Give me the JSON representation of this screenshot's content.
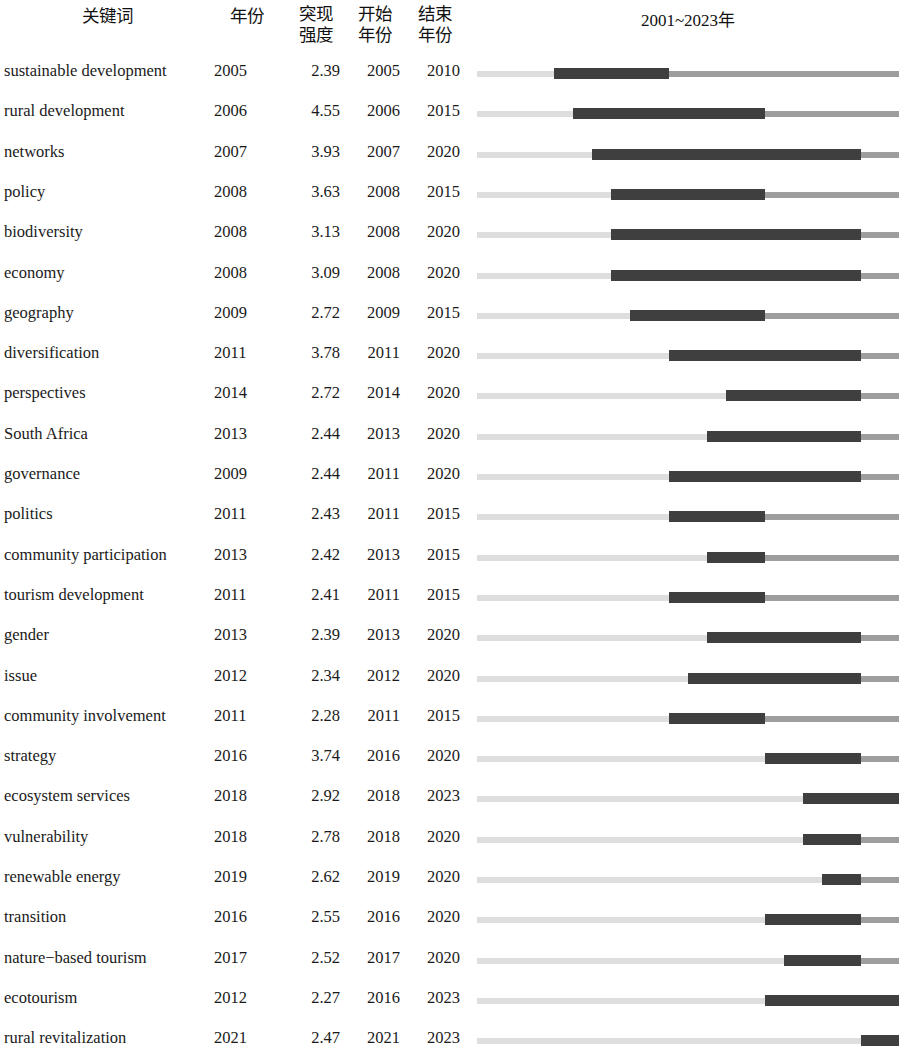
{
  "header": {
    "keyword": "关键词",
    "year": "年份",
    "strength": "突现\n强度",
    "begin": "开始\n年份",
    "end": "结束\n年份",
    "span": "2001~2023年"
  },
  "timeline": {
    "start_year": 2001,
    "end_year": 2023,
    "colors": {
      "pre_burst": "#dedede",
      "post_burst": "#9e9e9e",
      "burst": "#3f3f3f"
    }
  },
  "chart_data": {
    "type": "table",
    "xlabel": "2001~2023年",
    "ylabel": "关键词",
    "columns": [
      "关键词",
      "年份",
      "突现强度",
      "开始年份",
      "结束年份",
      "2001~2023年"
    ],
    "axis_range": [
      2001,
      2023
    ],
    "rows": [
      {
        "keyword": "sustainable development",
        "year": "2005",
        "strength": "2.39",
        "begin": "2005",
        "end": "2010",
        "begin_year": 2005,
        "end_year": 2010,
        "strength_value": 2.39
      },
      {
        "keyword": "rural development",
        "year": "2006",
        "strength": "4.55",
        "begin": "2006",
        "end": "2015",
        "begin_year": 2006,
        "end_year": 2015,
        "strength_value": 4.55
      },
      {
        "keyword": "networks",
        "year": "2007",
        "strength": "3.93",
        "begin": "2007",
        "end": "2020",
        "begin_year": 2007,
        "end_year": 2020,
        "strength_value": 3.93
      },
      {
        "keyword": "policy",
        "year": "2008",
        "strength": "3.63",
        "begin": "2008",
        "end": "2015",
        "begin_year": 2008,
        "end_year": 2015,
        "strength_value": 3.63
      },
      {
        "keyword": "biodiversity",
        "year": "2008",
        "strength": "3.13",
        "begin": "2008",
        "end": "2020",
        "begin_year": 2008,
        "end_year": 2020,
        "strength_value": 3.13
      },
      {
        "keyword": "economy",
        "year": "2008",
        "strength": "3.09",
        "begin": "2008",
        "end": "2020",
        "begin_year": 2008,
        "end_year": 2020,
        "strength_value": 3.09
      },
      {
        "keyword": "geography",
        "year": "2009",
        "strength": "2.72",
        "begin": "2009",
        "end": "2015",
        "begin_year": 2009,
        "end_year": 2015,
        "strength_value": 2.72
      },
      {
        "keyword": "diversification",
        "year": "2011",
        "strength": "3.78",
        "begin": "2011",
        "end": "2020",
        "begin_year": 2011,
        "end_year": 2020,
        "strength_value": 3.78
      },
      {
        "keyword": "perspectives",
        "year": "2014",
        "strength": "2.72",
        "begin": "2014",
        "end": "2020",
        "begin_year": 2014,
        "end_year": 2020,
        "strength_value": 2.72
      },
      {
        "keyword": "South Africa",
        "year": "2013",
        "strength": "2.44",
        "begin": "2013",
        "end": "2020",
        "begin_year": 2013,
        "end_year": 2020,
        "strength_value": 2.44
      },
      {
        "keyword": "governance",
        "year": "2009",
        "strength": "2.44",
        "begin": "2011",
        "end": "2020",
        "begin_year": 2011,
        "end_year": 2020,
        "strength_value": 2.44
      },
      {
        "keyword": "politics",
        "year": "2011",
        "strength": "2.43",
        "begin": "2011",
        "end": "2015",
        "begin_year": 2011,
        "end_year": 2015,
        "strength_value": 2.43
      },
      {
        "keyword": "community participation",
        "year": "2013",
        "strength": "2.42",
        "begin": "2013",
        "end": "2015",
        "begin_year": 2013,
        "end_year": 2015,
        "strength_value": 2.42
      },
      {
        "keyword": "tourism development",
        "year": "2011",
        "strength": "2.41",
        "begin": "2011",
        "end": "2015",
        "begin_year": 2011,
        "end_year": 2015,
        "strength_value": 2.41
      },
      {
        "keyword": "gender",
        "year": "2013",
        "strength": "2.39",
        "begin": "2013",
        "end": "2020",
        "begin_year": 2013,
        "end_year": 2020,
        "strength_value": 2.39
      },
      {
        "keyword": "issue",
        "year": "2012",
        "strength": "2.34",
        "begin": "2012",
        "end": "2020",
        "begin_year": 2012,
        "end_year": 2020,
        "strength_value": 2.34
      },
      {
        "keyword": "community involvement",
        "year": "2011",
        "strength": "2.28",
        "begin": "2011",
        "end": "2015",
        "begin_year": 2011,
        "end_year": 2015,
        "strength_value": 2.28
      },
      {
        "keyword": "strategy",
        "year": "2016",
        "strength": "3.74",
        "begin": "2016",
        "end": "2020",
        "begin_year": 2016,
        "end_year": 2020,
        "strength_value": 3.74
      },
      {
        "keyword": "ecosystem services",
        "year": "2018",
        "strength": "2.92",
        "begin": "2018",
        "end": "2023",
        "begin_year": 2018,
        "end_year": 2023,
        "strength_value": 2.92
      },
      {
        "keyword": "vulnerability",
        "year": "2018",
        "strength": "2.78",
        "begin": "2018",
        "end": "2020",
        "begin_year": 2018,
        "end_year": 2020,
        "strength_value": 2.78
      },
      {
        "keyword": "renewable energy",
        "year": "2019",
        "strength": "2.62",
        "begin": "2019",
        "end": "2020",
        "begin_year": 2019,
        "end_year": 2020,
        "strength_value": 2.62
      },
      {
        "keyword": "transition",
        "year": "2016",
        "strength": "2.55",
        "begin": "2016",
        "end": "2020",
        "begin_year": 2016,
        "end_year": 2020,
        "strength_value": 2.55
      },
      {
        "keyword": "nature−based tourism",
        "year": "2017",
        "strength": "2.52",
        "begin": "2017",
        "end": "2020",
        "begin_year": 2017,
        "end_year": 2020,
        "strength_value": 2.52
      },
      {
        "keyword": "ecotourism",
        "year": "2012",
        "strength": "2.27",
        "begin": "2016",
        "end": "2023",
        "begin_year": 2016,
        "end_year": 2023,
        "strength_value": 2.27
      },
      {
        "keyword": "rural revitalization",
        "year": "2021",
        "strength": "2.47",
        "begin": "2021",
        "end": "2023",
        "begin_year": 2021,
        "end_year": 2023,
        "strength_value": 2.47
      }
    ]
  }
}
